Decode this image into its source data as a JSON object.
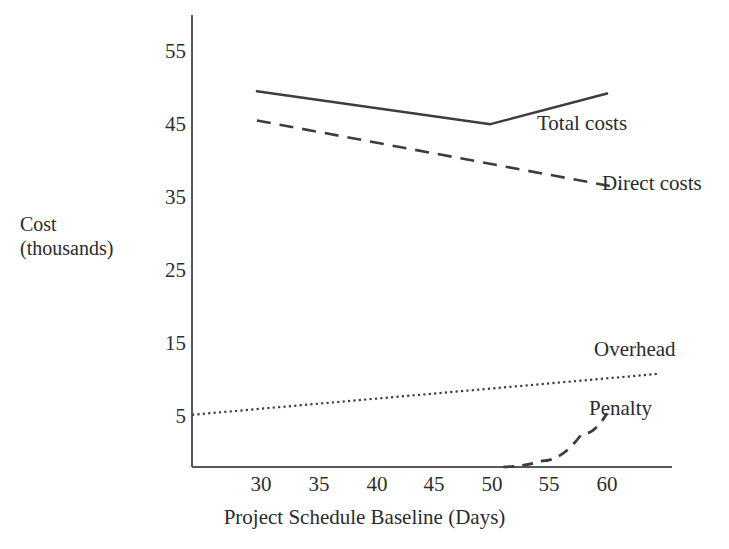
{
  "chart_data": {
    "type": "line",
    "title": "",
    "xlabel": "Project Schedule Baseline (Days)",
    "ylabel": "Cost (thousands)",
    "ylabel_lines": [
      "Cost",
      "(thousands)"
    ],
    "xlim": [
      26,
      63
    ],
    "ylim": [
      -2,
      58
    ],
    "xticks": [
      30,
      35,
      40,
      45,
      50,
      55,
      60
    ],
    "xticklabels": [
      "30",
      "35",
      "40",
      "45",
      "50",
      "55",
      "60"
    ],
    "yticks": [
      5,
      15,
      25,
      35,
      45,
      55
    ],
    "yticklabels": [
      "5",
      "15",
      "25",
      "35",
      "45",
      "55"
    ],
    "grid": false,
    "legend": "inline-annotations",
    "series": [
      {
        "name": "Total costs",
        "label": "Total costs",
        "style": "solid",
        "color": "#3d3d3d",
        "x": [
          31,
          49,
          58
        ],
        "values": [
          49.5,
          45.0,
          49.2
        ]
      },
      {
        "name": "Direct costs",
        "label": "Direct costs",
        "style": "dashed",
        "color": "#3d3d3d",
        "x": [
          31,
          59
        ],
        "values": [
          45.5,
          36.3
        ]
      },
      {
        "name": "Overhead",
        "label": "Overhead",
        "style": "dotted",
        "color": "#3d3d3d",
        "x": [
          26,
          62
        ],
        "values": [
          5.3,
          10.9
        ]
      },
      {
        "name": "Penalty",
        "label": "Penalty",
        "style": "dashed",
        "color": "#3d3d3d",
        "x": [
          50,
          53,
          56,
          58
        ],
        "values": [
          -1.8,
          -1.0,
          2.6,
          5.5
        ]
      }
    ]
  },
  "axes": {
    "x_title": "Project Schedule Baseline (Days)",
    "y_title_line1": "Cost",
    "y_title_line2": "(thousands)",
    "x_tick_0": "30",
    "x_tick_1": "35",
    "x_tick_2": "40",
    "x_tick_3": "45",
    "x_tick_4": "50",
    "x_tick_5": "55",
    "x_tick_6": "60",
    "y_tick_0": "55",
    "y_tick_1": "45",
    "y_tick_2": "35",
    "y_tick_3": "25",
    "y_tick_4": "15",
    "y_tick_5": "5"
  },
  "annotations": {
    "total_costs": "Total costs",
    "direct_costs": "Direct costs",
    "overhead": "Overhead",
    "penalty": "Penalty"
  },
  "colors": {
    "line": "#3d3d3d",
    "axis": "#585858",
    "text": "#2b2b2b",
    "background": "#ffffff"
  }
}
